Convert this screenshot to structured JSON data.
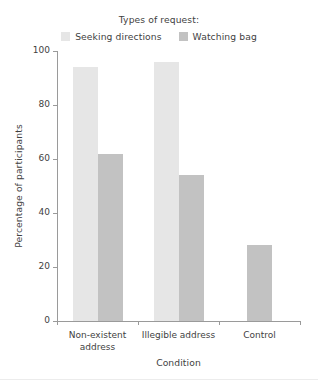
{
  "legend": {
    "title": "Types of request:",
    "entries": [
      {
        "label": "Seeking directions",
        "color": "#e6e6e6"
      },
      {
        "label": "Watching bag",
        "color": "#c2c2c2"
      }
    ]
  },
  "axes": {
    "ylabel": "Percentage of participants",
    "xlabel": "Condition",
    "yticks": [
      "0",
      "20",
      "40",
      "60",
      "80",
      "100"
    ]
  },
  "categories": [
    {
      "label": "Non-existent\naddress"
    },
    {
      "label": "Illegible address"
    },
    {
      "label": "Control"
    }
  ],
  "chart_data": {
    "type": "bar",
    "title": "",
    "subtitle": "",
    "xlabel": "Condition",
    "ylabel": "Percentage of participants",
    "categories": [
      "Non-existent address",
      "Illegible address",
      "Control"
    ],
    "series": [
      {
        "name": "Seeking directions",
        "color": "#e6e6e6",
        "values": [
          94,
          96,
          null
        ]
      },
      {
        "name": "Watching bag",
        "color": "#c2c2c2",
        "values": [
          62,
          54,
          28
        ]
      }
    ],
    "ylim": [
      0,
      100
    ],
    "ytick_values": [
      0,
      20,
      40,
      60,
      80,
      100
    ],
    "grid": false,
    "legend_position": "top-center",
    "legend_title": "Types of request:",
    "annotations": []
  }
}
